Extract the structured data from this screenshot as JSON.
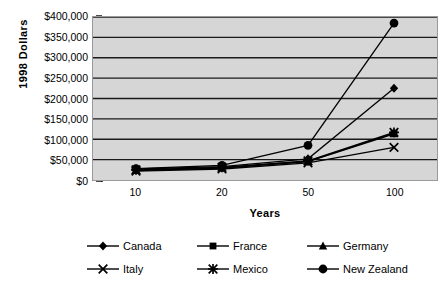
{
  "chart_data": {
    "type": "line",
    "title": "",
    "xlabel": "Years",
    "ylabel": "1998 Dollars",
    "x": [
      10,
      20,
      50,
      100
    ],
    "categories": [
      "10",
      "20",
      "50",
      "100"
    ],
    "ylim": [
      0,
      400000
    ],
    "ytick_values": [
      0,
      50000,
      100000,
      150000,
      200000,
      250000,
      300000,
      350000,
      400000
    ],
    "ytick_labels": [
      "$0",
      "$50,000",
      "$100,000",
      "$150,000",
      "$200,000",
      "$250,000",
      "$300,000",
      "$350,000",
      "$400,000"
    ],
    "grid": true,
    "legend_position": "bottom",
    "series": [
      {
        "name": "Canada",
        "marker": "diamond",
        "values": [
          27000,
          33000,
          52000,
          225000
        ]
      },
      {
        "name": "France",
        "marker": "square",
        "values": [
          24000,
          30000,
          46000,
          115000
        ]
      },
      {
        "name": "Germany",
        "marker": "triangle",
        "values": [
          23000,
          29000,
          45000,
          113000
        ]
      },
      {
        "name": "Italy",
        "marker": "x",
        "values": [
          22000,
          27000,
          42000,
          80000
        ]
      },
      {
        "name": "Mexico",
        "marker": "star",
        "values": [
          25000,
          31000,
          47000,
          117000
        ]
      },
      {
        "name": "New Zealand",
        "marker": "circle",
        "values": [
          28000,
          36000,
          85000,
          385000
        ]
      }
    ]
  },
  "legend": {
    "items": [
      {
        "label": "Canada"
      },
      {
        "label": "France"
      },
      {
        "label": "Germany"
      },
      {
        "label": "Italy"
      },
      {
        "label": "Mexico"
      },
      {
        "label": "New Zealand"
      }
    ]
  },
  "colors": {
    "plot_background": "#d6d6d6",
    "gridline": "#1a1a1a",
    "series": "#000000",
    "page_background": "#ffffff"
  }
}
